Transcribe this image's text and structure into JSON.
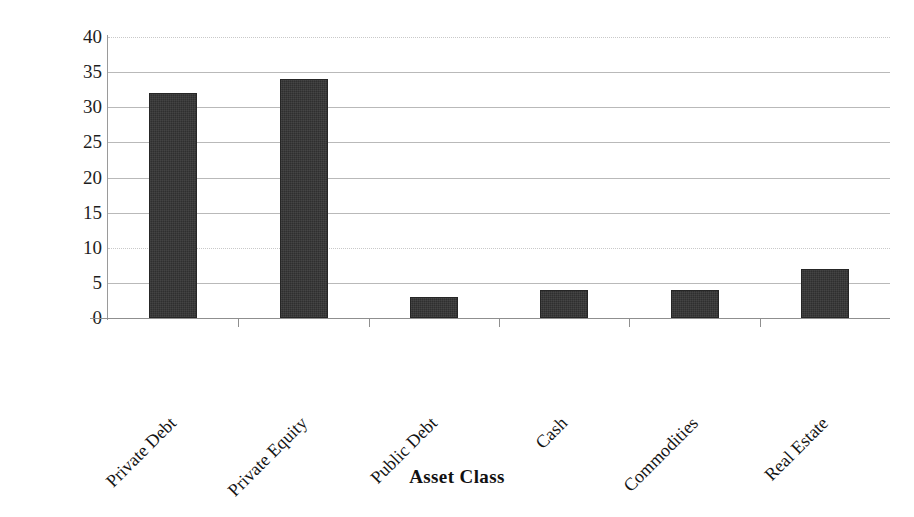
{
  "chart_data": {
    "type": "bar",
    "title": "",
    "categories": [
      "Private Debt",
      "Private Equity",
      "Public Debt",
      "Cash",
      "Commodities",
      "Real Estate"
    ],
    "values": [
      32,
      34,
      3,
      4,
      4,
      7
    ],
    "xlabel": "Asset Class",
    "ylabel": "Frequency",
    "ylim": [
      0,
      40
    ],
    "ytick_labels": [
      "0",
      "5",
      "10",
      "15",
      "20",
      "25",
      "30",
      "35",
      "40"
    ],
    "ytick_values": [
      0,
      5,
      10,
      15,
      20,
      25,
      30,
      35,
      40
    ],
    "grid": "horizontal",
    "legend": "none",
    "bar_color": "#2f2f2f",
    "gridline_color": "#b9b9b9",
    "axis_color": "#8f8f8f",
    "background_color": "#ffffff",
    "category_label_rotation": -45
  }
}
